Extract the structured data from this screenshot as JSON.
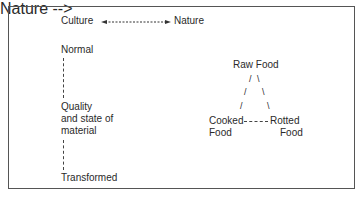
{
  "diagram": {
    "axis": {
      "left_label": "Culture",
      "right_label": "Nature",
      "connector": "bidirectional-dashed-arrow"
    },
    "vertical_scale": {
      "top_label": "Normal",
      "middle_label_line1": "Quality",
      "middle_label_line2": "and state of",
      "middle_label_line3": "material",
      "bottom_label": "Transformed"
    },
    "triangle": {
      "apex": "Raw Food",
      "left_line1": "Cooked",
      "left_line2": "Food",
      "right_line1": "Rotted",
      "right_line2": "Food",
      "left_edge_glyph": "/",
      "right_edge_glyph": "\\"
    }
  }
}
